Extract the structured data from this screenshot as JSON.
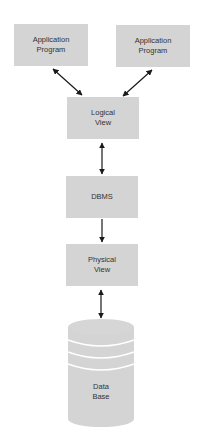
{
  "diagram": {
    "nodes": {
      "app1": {
        "line1": "Application",
        "line2": "Program"
      },
      "app2": {
        "line1": "Application",
        "line2": "Program"
      },
      "logical": {
        "line1": "Logical",
        "line2": "View"
      },
      "dbms": {
        "line1": "DBMS"
      },
      "physical": {
        "line1": "Physical",
        "line2": "View"
      },
      "database": {
        "line1": "Data",
        "line2": "Base"
      }
    },
    "edges": [
      {
        "from": "app1",
        "to": "logical",
        "direction": "both"
      },
      {
        "from": "app2",
        "to": "logical",
        "direction": "both"
      },
      {
        "from": "logical",
        "to": "dbms",
        "direction": "both"
      },
      {
        "from": "dbms",
        "to": "physical",
        "direction": "forward"
      },
      {
        "from": "physical",
        "to": "database",
        "direction": "both"
      }
    ],
    "colors": {
      "box_fill": "#d4d4d4",
      "arrow": "#1a1a1a",
      "text": "#333333"
    }
  }
}
